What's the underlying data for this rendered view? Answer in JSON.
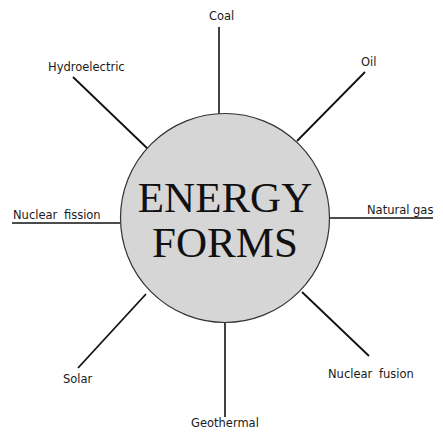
{
  "diagram": {
    "type": "spider-diagram",
    "center": {
      "line1": "ENERGY",
      "line2": "FORMS",
      "fill_color": "#d6d6d6",
      "stroke_color": "#333333"
    },
    "branches": [
      {
        "id": "coal",
        "label": "Coal"
      },
      {
        "id": "oil",
        "label": "Oil"
      },
      {
        "id": "natural-gas",
        "label": "Natural gas"
      },
      {
        "id": "nuclear-fusion",
        "label": "Nuclear fusion"
      },
      {
        "id": "geothermal",
        "label": "Geothermal"
      },
      {
        "id": "solar",
        "label": "Solar"
      },
      {
        "id": "nuclear-fission",
        "label": "Nuclear fission"
      },
      {
        "id": "hydroelectric",
        "label": "Hydroelectric"
      }
    ],
    "line_color": "#111111"
  }
}
